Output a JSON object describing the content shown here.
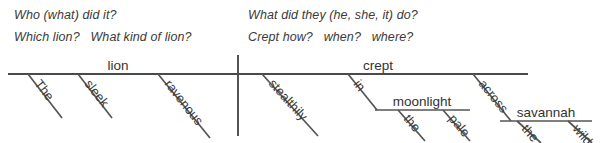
{
  "prompts": {
    "subject_line_1": "Who (what) did it?",
    "subject_line_2": "Which lion?   What kind of lion?",
    "predicate_line_1": "What did they (he, she, it) do?",
    "predicate_line_2": "Crept how?   when?   where?"
  },
  "diagram": {
    "type": "reed-kellogg-sentence-diagram",
    "sentence": "The sleek ravenous lion crept stealthily in the pale moonlight across the wild savannah",
    "line_color": "#4a4a4a",
    "subject": {
      "headword": "lion",
      "modifiers": [
        "The",
        "sleek",
        "ravenous"
      ]
    },
    "predicate": {
      "headword": "crept",
      "modifiers": [
        "stealthily"
      ],
      "prepositional_phrases": [
        {
          "preposition": "in",
          "object": "moonlight",
          "object_modifiers": [
            "the",
            "pale"
          ]
        },
        {
          "preposition": "across",
          "object": "savannah",
          "object_modifiers": [
            "the",
            "wild"
          ]
        }
      ]
    }
  },
  "geometry": {
    "baseline_y": 74,
    "baseline_x1": 8,
    "baseline_x2": 528,
    "divider_x": 238,
    "divider_y1": 55,
    "divider_y2": 136,
    "moonlight_line_y": 110,
    "savannah_line_y": 121
  }
}
